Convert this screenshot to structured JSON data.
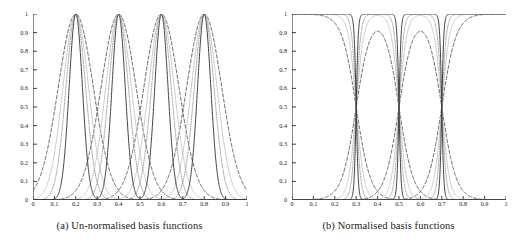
{
  "figure": {
    "panels": [
      {
        "id": "panel-a",
        "caption": "(a) Un-normalised basis functions"
      },
      {
        "id": "panel-b",
        "caption": "(b) Normalised basis functions"
      }
    ]
  },
  "axis": {
    "x_ticks": [
      "0",
      "0.1",
      "0.2",
      "0.3",
      "0.4",
      "0.5",
      "0.6",
      "0.7",
      "0.8",
      "0.9",
      "1"
    ],
    "y_ticks": [
      "0",
      "0.1",
      "0.2",
      "0.3",
      "0.4",
      "0.5",
      "0.6",
      "0.7",
      "0.8",
      "0.9",
      "1"
    ]
  },
  "colors": {
    "axis": "#2b2b2b",
    "text": "#1a1a1a",
    "curve_solid": "#3a3a3a",
    "curve_dashed": "#4a4a4a",
    "curve_dotted": "#8a8a8a",
    "curve_light": "#c2c2c2",
    "background": "#ffffff"
  },
  "chart_data": [
    {
      "type": "line",
      "title": "(a) Un-normalised basis functions",
      "xlabel": "",
      "ylabel": "",
      "xlim": [
        0,
        1
      ],
      "ylim": [
        0,
        1
      ],
      "xticks": [
        0,
        0.1,
        0.2,
        0.3,
        0.4,
        0.5,
        0.6,
        0.7,
        0.8,
        0.9,
        1
      ],
      "yticks": [
        0,
        0.1,
        0.2,
        0.3,
        0.4,
        0.5,
        0.6,
        0.7,
        0.8,
        0.9,
        1
      ],
      "grid": false,
      "legend": "none",
      "description": "Four families of un-normalised Gaussian basis functions of differing widths, each family with peaks of height 1 centred at 0.2, 0.4, 0.6 and 0.8.",
      "centres": [
        0.2,
        0.4,
        0.6,
        0.8
      ],
      "peak_value": 1.0,
      "series": [
        {
          "name": "solid-narrow",
          "style": "solid",
          "color": "#3a3a3a",
          "width_sigma": 0.031,
          "centres": [
            0.2,
            0.4,
            0.6,
            0.8
          ],
          "amplitude": 1.0
        },
        {
          "name": "dotted-medium",
          "style": "dotted",
          "color": "#8a8a8a",
          "width_sigma": 0.046,
          "centres": [
            0.2,
            0.4,
            0.6,
            0.8
          ],
          "amplitude": 1.0
        },
        {
          "name": "light-grey-medium",
          "style": "solid",
          "color": "#c2c2c2",
          "width_sigma": 0.06,
          "centres": [
            0.2,
            0.4,
            0.6,
            0.8
          ],
          "amplitude": 1.0
        },
        {
          "name": "dashed-wide",
          "style": "dashed",
          "color": "#4a4a4a",
          "width_sigma": 0.082,
          "centres": [
            0.2,
            0.4,
            0.6,
            0.8
          ],
          "amplitude": 1.0
        }
      ]
    },
    {
      "type": "line",
      "title": "(b) Normalised basis functions",
      "xlabel": "",
      "ylabel": "",
      "xlim": [
        0,
        1
      ],
      "ylim": [
        0,
        1
      ],
      "xticks": [
        0,
        0.1,
        0.2,
        0.3,
        0.4,
        0.5,
        0.6,
        0.7,
        0.8,
        0.9,
        1
      ],
      "yticks": [
        0,
        0.1,
        0.2,
        0.3,
        0.4,
        0.5,
        0.6,
        0.7,
        0.8,
        0.9,
        1
      ],
      "grid": false,
      "description": "Normalised versions of the same basis functions. Outer functions form plateaus at 1 with sharp notches at the crossover points 0.3, 0.5 and 0.7; the interior functions appear as narrow spikes and broad humps peaking near 1, 0.95 and 0.75 depending on width.",
      "notch_positions": [
        0.3,
        0.5,
        0.7
      ],
      "series": [
        {
          "name": "solid-narrow",
          "style": "solid",
          "color": "#3a3a3a",
          "width_sigma": 0.031,
          "plateau_value": 1.0,
          "interior_peak": 1.0
        },
        {
          "name": "dotted-medium",
          "style": "dotted",
          "color": "#8a8a8a",
          "width_sigma": 0.046,
          "plateau_value": 1.0,
          "interior_peak": 0.98
        },
        {
          "name": "light-grey-medium",
          "style": "solid",
          "color": "#c2c2c2",
          "width_sigma": 0.06,
          "plateau_value": 1.0,
          "interior_peak": 0.92
        },
        {
          "name": "dashed-wide",
          "style": "dashed",
          "color": "#4a4a4a",
          "width_sigma": 0.082,
          "plateau_value": 1.0,
          "interior_peak": 0.75
        }
      ]
    }
  ]
}
